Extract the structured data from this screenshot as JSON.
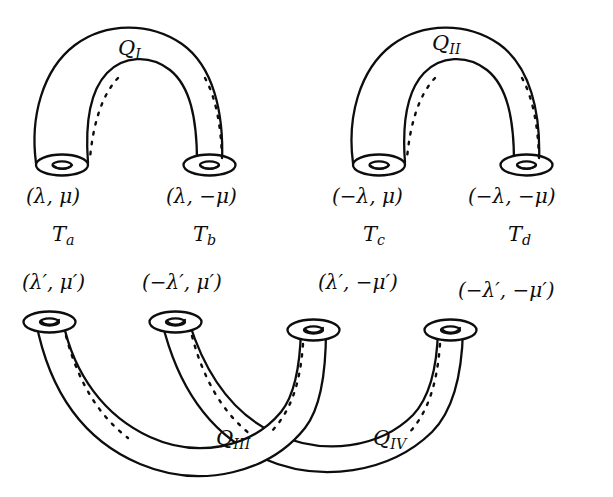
{
  "figure": {
    "type": "topology-diagram",
    "background_color": "#ffffff",
    "ink_color": "#0d0d0d"
  },
  "tubes": [
    {
      "id": "Q1",
      "label": "Q",
      "subscript": "I",
      "orientation": "arch-up",
      "connects": [
        "Ta",
        "Tb"
      ]
    },
    {
      "id": "Q2",
      "label": "Q",
      "subscript": "II",
      "orientation": "arch-up",
      "connects": [
        "Tc",
        "Td"
      ]
    },
    {
      "id": "Q3",
      "label": "Q",
      "subscript": "III",
      "orientation": "arch-down",
      "connects": [
        "Ta-prime",
        "Tc-prime"
      ]
    },
    {
      "id": "Q4",
      "label": "Q",
      "subscript": "IV",
      "orientation": "arch-down",
      "connects": [
        "Tb-prime",
        "Td-prime"
      ]
    }
  ],
  "top_coordinates": [
    {
      "id": "coord-a",
      "text": "(λ, μ)"
    },
    {
      "id": "coord-b",
      "text": "(λ, −μ)"
    },
    {
      "id": "coord-c",
      "text": "(−λ, μ)"
    },
    {
      "id": "coord-d",
      "text": "(−λ, −μ)"
    }
  ],
  "torus_labels": [
    {
      "id": "Ta",
      "label": "T",
      "subscript": "a"
    },
    {
      "id": "Tb",
      "label": "T",
      "subscript": "b"
    },
    {
      "id": "Tc",
      "label": "T",
      "subscript": "c"
    },
    {
      "id": "Td",
      "label": "T",
      "subscript": "d"
    }
  ],
  "bottom_coordinates": [
    {
      "id": "coord-a-prime",
      "text": "(λ′, μ′)"
    },
    {
      "id": "coord-b-prime",
      "text": "(−λ′, μ′)"
    },
    {
      "id": "coord-c-prime",
      "text": "(λ′, −μ′)"
    },
    {
      "id": "coord-d-prime",
      "text": "(−λ′, −μ′)"
    }
  ],
  "q_labels": {
    "q1_base": "Q",
    "q1_sub": "I",
    "q2_base": "Q",
    "q2_sub": "II",
    "q3_base": "Q",
    "q3_sub": "III",
    "q4_base": "Q",
    "q4_sub": "IV"
  },
  "t_labels": {
    "ta_base": "T",
    "ta_sub": "a",
    "tb_base": "T",
    "tb_sub": "b",
    "tc_base": "T",
    "tc_sub": "c",
    "td_base": "T",
    "td_sub": "d"
  }
}
